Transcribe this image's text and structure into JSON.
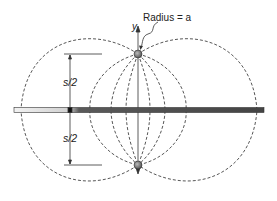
{
  "diagram": {
    "labels": {
      "radius": "Radius = a",
      "y_axis": "y",
      "upper_half": "s/2",
      "lower_half": "s/2"
    },
    "colors": {
      "line": "#333333",
      "plane_dark": "#555555",
      "plane_light": "#e8e8e8",
      "conductor": "#777777"
    }
  }
}
